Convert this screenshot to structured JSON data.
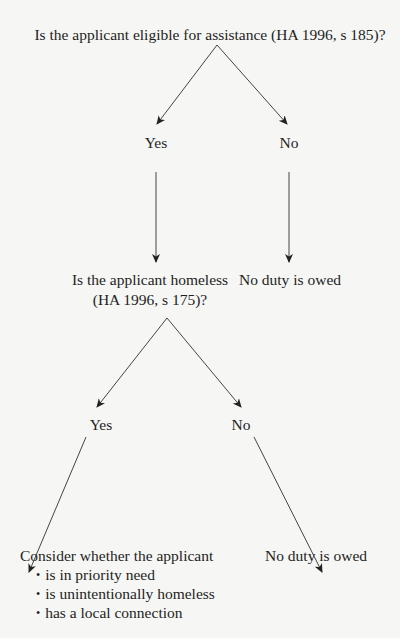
{
  "diagram": {
    "type": "decision-tree",
    "root": {
      "question": "Is the applicant eligible for assistance (HA 1996, s 185)?",
      "branches": [
        {
          "label": "Yes",
          "next": {
            "question_line1": "Is the applicant homeless",
            "question_line2": "(HA 1996, s 175)?",
            "branches": [
              {
                "label": "Yes",
                "outcome": {
                  "text": "Consider whether the applicant",
                  "criteria": [
                    "is in priority need",
                    "is unintentionally homeless",
                    "has a local connection"
                  ]
                }
              },
              {
                "label": "No",
                "outcome": {
                  "text": "No duty is owed"
                }
              }
            ]
          }
        },
        {
          "label": "No",
          "outcome": {
            "text": "No duty is owed"
          }
        }
      ]
    },
    "colors": {
      "background": "#f6f6f4",
      "text": "#1e1e1e",
      "lines": "#333333"
    }
  }
}
